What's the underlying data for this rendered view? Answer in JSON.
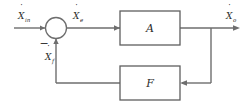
{
  "diagram": {
    "type": "control-system-block-diagram",
    "background_color": "#ffffff",
    "line_color": "#6e6e6e",
    "text_color": "#2b2b2b"
  },
  "signals": {
    "input": {
      "base": "X",
      "dot": "˙",
      "subscript": "in",
      "full": "Ẋin",
      "description": "input reference rate"
    },
    "error": {
      "base": "X",
      "dot": "˙",
      "subscript": "e",
      "full": "Ẋe",
      "description": "error signal into block A"
    },
    "output": {
      "base": "X",
      "dot": "˙",
      "subscript": "o",
      "full": "Ẋo",
      "description": "output of block A"
    },
    "feedback": {
      "base": "X",
      "dot": "˙",
      "subscript": "f",
      "full": "Ẋf",
      "description": "feedback signal from block F"
    }
  },
  "summing_junction": {
    "name": "summing-junction",
    "sign": "−",
    "sign_position": "lower-left"
  },
  "blocks": [
    {
      "id": "block-a",
      "label": "A",
      "x": 120,
      "y": 11,
      "width": 60,
      "height": 34
    },
    {
      "id": "block-f",
      "label": "F",
      "x": 120,
      "y": 66,
      "width": 60,
      "height": 34
    }
  ]
}
